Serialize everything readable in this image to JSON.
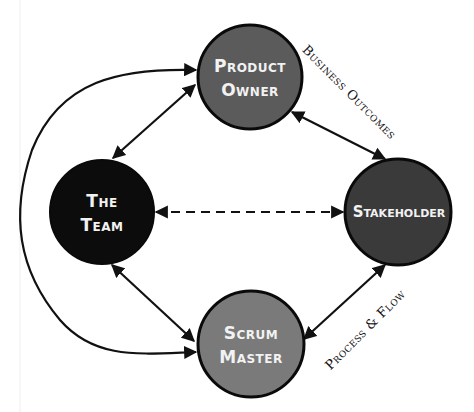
{
  "diagram": {
    "type": "relationship-network",
    "nodes": [
      {
        "id": "product_owner",
        "label_line1": "Product",
        "label_line2": "Owner",
        "fill": "#5b5b5b",
        "cx": 250,
        "cy": 77,
        "r": 52
      },
      {
        "id": "the_team",
        "label_line1": "The",
        "label_line2": "Team",
        "fill": "#0c0c0c",
        "cx": 102,
        "cy": 212,
        "r": 52
      },
      {
        "id": "stakeholder",
        "label_line1": "Stakeholder",
        "label_line2": "",
        "fill": "#3a3a3a",
        "cx": 398,
        "cy": 212,
        "r": 53
      },
      {
        "id": "scrum_master",
        "label_line1": "Scrum",
        "label_line2": "Master",
        "fill": "#7a7a7a",
        "cx": 251,
        "cy": 344,
        "r": 53
      }
    ],
    "edges": [
      {
        "from": "product_owner",
        "to": "the_team",
        "style": "solid",
        "direction": "both",
        "label": ""
      },
      {
        "from": "product_owner",
        "to": "stakeholder",
        "style": "solid",
        "direction": "both",
        "label": "Business Outcomes"
      },
      {
        "from": "the_team",
        "to": "stakeholder",
        "style": "dashed",
        "direction": "both",
        "label": ""
      },
      {
        "from": "the_team",
        "to": "scrum_master",
        "style": "solid",
        "direction": "both",
        "label": ""
      },
      {
        "from": "scrum_master",
        "to": "stakeholder",
        "style": "solid",
        "direction": "both",
        "label": "Process & Flow"
      },
      {
        "from": "product_owner",
        "to": "scrum_master",
        "style": "solid-curved-left",
        "direction": "both",
        "label": ""
      }
    ],
    "edge_labels": {
      "business_outcomes": "Business Outcomes",
      "process_flow": "Process & Flow"
    },
    "colors": {
      "background": "#ffffff",
      "line": "#111111",
      "label_text": "#f2f2f2"
    }
  }
}
